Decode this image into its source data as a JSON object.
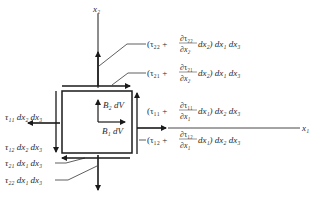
{
  "diagram": {
    "axes": {
      "x1": "x₁",
      "x2": "x₂"
    },
    "body_forces": {
      "b1": "B₁ dV",
      "b2": "B₂ dV"
    },
    "right_labels": {
      "top_normal": {
        "pre": "(τ₂₂ + ",
        "num": "∂τ₂₂",
        "den": "∂x₂",
        "post": " dx₂) dx₁ dx₃"
      },
      "top_shear": {
        "pre": "(τ₂₁ + ",
        "num": "∂τ₂₁",
        "den": "∂x₂",
        "post": " dx₂) dx₁ dx₃"
      },
      "right_normal": {
        "pre": "(τ₁₁ + ",
        "num": "∂τ₁₁",
        "den": "∂x₁",
        "post": " dx₁) dx₂ dx₃"
      },
      "right_shear": {
        "pre": "(τ₁₂ + ",
        "num": "∂τ₁₂",
        "den": "∂x₁",
        "post": " dx₁) dx₂ dx₃"
      }
    },
    "left_labels": {
      "left_normal": "τ₁₁ dx₂ dx₃",
      "left_shear": "τ₁₂ dx₂ dx₃",
      "bottom_shear": "τ₂₁ dx₁ dx₃",
      "bottom_normal": "τ₂₂ dx₁ dx₃"
    },
    "colors": {
      "line": "#1a1a1a",
      "text": "#2a2a2a"
    }
  }
}
